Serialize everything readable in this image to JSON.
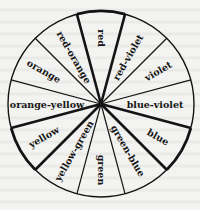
{
  "diagram": {
    "type": "color-wheel",
    "center": [
      101,
      104
    ],
    "radius": 93,
    "segment_count": 12,
    "start_angle_deg": -15,
    "colors": {
      "line": "#141414",
      "text": "#161616",
      "background": "#f3f3f1"
    },
    "segments": [
      {
        "label": "red",
        "angle": 0,
        "primary": true
      },
      {
        "label": "red-violet",
        "angle": 30,
        "primary": false
      },
      {
        "label": "violet",
        "angle": 60,
        "primary": false
      },
      {
        "label": "blue-violet",
        "angle": 90,
        "primary": false
      },
      {
        "label": "blue",
        "angle": 120,
        "primary": true
      },
      {
        "label": "green-blue",
        "angle": 150,
        "primary": false
      },
      {
        "label": "green",
        "angle": 180,
        "primary": false
      },
      {
        "label": "yellow-green",
        "angle": 210,
        "primary": false
      },
      {
        "label": "yellow",
        "angle": 240,
        "primary": true
      },
      {
        "label": "orange-yellow",
        "angle": 270,
        "primary": false
      },
      {
        "label": "orange",
        "angle": 300,
        "primary": false
      },
      {
        "label": "red-orange",
        "angle": 330,
        "primary": false
      }
    ]
  }
}
